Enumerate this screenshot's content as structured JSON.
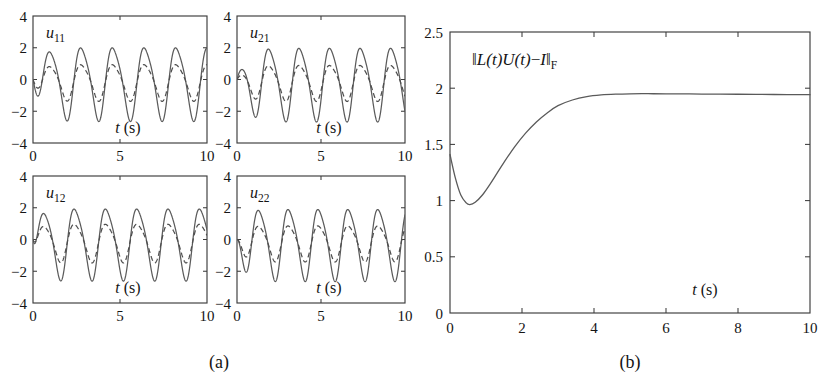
{
  "figure": {
    "background": "#ffffff",
    "ink_color": "#3c3c3c",
    "curve_color": "#5b5b5b",
    "width": 822,
    "height": 375
  },
  "panels": [
    {
      "id": "a",
      "caption": "(a)"
    },
    {
      "id": "b",
      "caption": "(b)"
    }
  ],
  "chart_data": [
    {
      "type": "line",
      "panel": "a",
      "subplot": "u11",
      "title": "u",
      "title_sub": "11",
      "xlabel_symbol": "t",
      "xlabel_unit": "(s)",
      "ylabel": "",
      "xlim": [
        0,
        10
      ],
      "ylim": [
        -4,
        4
      ],
      "xticks": [
        0,
        5,
        10
      ],
      "xticklabels": [
        "0",
        "5",
        "10"
      ],
      "yticks": [
        -4,
        -2,
        0,
        2,
        4
      ],
      "yticklabels": [
        "-4",
        "-2",
        "0",
        "2",
        "4"
      ],
      "grid": false,
      "legend": "none",
      "series": [
        {
          "name": "solid",
          "style": "solid",
          "waveform": "damped-onset sinusoid",
          "amplitude": 2.25,
          "period": 1.82,
          "phase": 0.55,
          "offset": -0.12,
          "onset": 0.45
        },
        {
          "name": "dashed",
          "style": "dashed",
          "waveform": "damped-onset sinusoid",
          "amplitude": 1.12,
          "period": 1.82,
          "phase": 0.55,
          "offset": -0.12,
          "onset": 0.45
        }
      ]
    },
    {
      "type": "line",
      "panel": "a",
      "subplot": "u21",
      "title": "u",
      "title_sub": "21",
      "xlabel_symbol": "t",
      "xlabel_unit": "(s)",
      "ylabel": "",
      "xlim": [
        0,
        10
      ],
      "ylim": [
        -4,
        4
      ],
      "xticks": [
        0,
        5,
        10
      ],
      "xticklabels": [
        "0",
        "5",
        "10"
      ],
      "yticks": [
        -4,
        -2,
        0,
        2,
        4
      ],
      "yticklabels": [
        "-4",
        "-2",
        "0",
        "2",
        "4"
      ],
      "grid": false,
      "legend": "none",
      "series": [
        {
          "name": "solid",
          "style": "solid",
          "waveform": "damped-onset sinusoid",
          "amplitude": 2.25,
          "period": 1.82,
          "phase": 1.5,
          "offset": -0.15,
          "onset": 0.5
        },
        {
          "name": "dashed",
          "style": "dashed",
          "waveform": "damped-onset sinusoid",
          "amplitude": 1.1,
          "period": 1.82,
          "phase": 1.5,
          "offset": -0.15,
          "onset": 0.5
        }
      ]
    },
    {
      "type": "line",
      "panel": "a",
      "subplot": "u12",
      "title": "u",
      "title_sub": "12",
      "xlabel_symbol": "t",
      "xlabel_unit": "(s)",
      "ylabel": "",
      "xlim": [
        0,
        10
      ],
      "ylim": [
        -4,
        4
      ],
      "xticks": [
        0,
        5,
        10
      ],
      "xticklabels": [
        "0",
        "5",
        "10"
      ],
      "yticks": [
        -4,
        -2,
        0,
        2,
        4
      ],
      "yticklabels": [
        "-4",
        "-2",
        "0",
        "2",
        "4"
      ],
      "grid": false,
      "legend": "none",
      "series": [
        {
          "name": "solid",
          "style": "solid",
          "waveform": "damped-onset sinusoid",
          "amplitude": 2.2,
          "period": 1.8,
          "phase": 0.2,
          "offset": -0.15,
          "onset": 0.3
        },
        {
          "name": "dashed",
          "style": "dashed",
          "waveform": "damped-onset sinusoid",
          "amplitude": 1.18,
          "period": 1.8,
          "phase": 0.2,
          "offset": -0.15,
          "onset": 0.3
        }
      ]
    },
    {
      "type": "line",
      "panel": "a",
      "subplot": "u22",
      "title": "u",
      "title_sub": "22",
      "xlabel_symbol": "t",
      "xlabel_unit": "(s)",
      "ylabel": "",
      "xlim": [
        0,
        10
      ],
      "ylim": [
        -4,
        4
      ],
      "xticks": [
        0,
        5,
        10
      ],
      "xticklabels": [
        "0",
        "5",
        "10"
      ],
      "yticks": [
        -4,
        -2,
        0,
        2,
        4
      ],
      "yticklabels": [
        "-4",
        "-2",
        "0",
        "2",
        "4"
      ],
      "grid": false,
      "legend": "none",
      "series": [
        {
          "name": "solid",
          "style": "solid",
          "waveform": "damped-onset sinusoid",
          "amplitude": 2.2,
          "period": 1.78,
          "phase": 0.9,
          "offset": -0.18,
          "onset": 0.35
        },
        {
          "name": "dashed",
          "style": "dashed",
          "waveform": "damped-onset sinusoid",
          "amplitude": 1.1,
          "period": 1.78,
          "phase": 0.9,
          "offset": -0.18,
          "onset": 0.35
        }
      ]
    },
    {
      "type": "line",
      "panel": "b",
      "subplot": "residual-norm",
      "annotation_symbols": {
        "norm_open": "‖",
        "L": "L",
        "t1": "(t)",
        "U": "U",
        "t2": "(t)",
        "minus": "−",
        "I": "I",
        "norm_close": "‖",
        "frobenius": "F"
      },
      "annotation_plain": "‖L(t)U(t)−I‖F",
      "xlabel_symbol": "t",
      "xlabel_unit": "(s)",
      "ylabel": "",
      "xlim": [
        0,
        10
      ],
      "ylim": [
        0,
        2.5
      ],
      "xticks": [
        0,
        2,
        4,
        6,
        8,
        10
      ],
      "xticklabels": [
        "0",
        "2",
        "4",
        "6",
        "8",
        "10"
      ],
      "yticks": [
        0,
        0.5,
        1,
        1.5,
        2,
        2.5
      ],
      "yticklabels": [
        "0",
        "0.5",
        "1",
        "1.5",
        "2",
        "2.5"
      ],
      "grid": false,
      "legend": "none",
      "x": [
        0,
        0.15,
        0.3,
        0.45,
        0.55,
        0.7,
        0.9,
        1.1,
        1.3,
        1.5,
        1.8,
        2.1,
        2.4,
        2.7,
        3.0,
        3.4,
        3.8,
        4.2,
        4.6,
        5.0,
        5.5,
        6.0,
        7.0,
        8.0,
        9.0,
        10.0
      ],
      "y": [
        1.41,
        1.2,
        1.05,
        0.98,
        0.965,
        0.985,
        1.05,
        1.14,
        1.24,
        1.34,
        1.48,
        1.6,
        1.7,
        1.78,
        1.845,
        1.895,
        1.925,
        1.94,
        1.947,
        1.95,
        1.951,
        1.95,
        1.948,
        1.946,
        1.944,
        1.942
      ]
    }
  ]
}
